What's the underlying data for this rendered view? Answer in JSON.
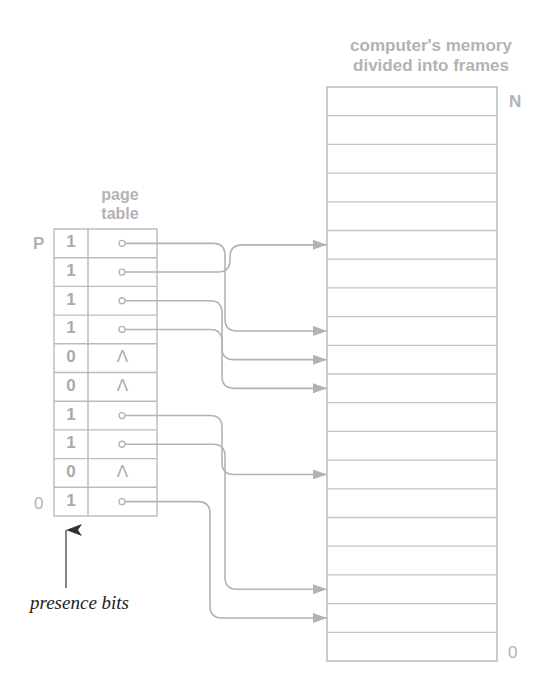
{
  "memory": {
    "title_line1": "computer's memory",
    "title_line2": "divided into frames",
    "top_label": "N",
    "bottom_label": "0",
    "frame_count": 20
  },
  "page_table": {
    "title_line1": "page",
    "title_line2": "table",
    "top_label": "P",
    "bottom_label": "0",
    "rows": [
      {
        "bit": "1",
        "entry": "pointer",
        "target_frame": 12
      },
      {
        "bit": "1",
        "entry": "pointer",
        "target_frame": 15
      },
      {
        "bit": "1",
        "entry": "pointer",
        "target_frame": 11
      },
      {
        "bit": "1",
        "entry": "pointer",
        "target_frame": 10
      },
      {
        "bit": "0",
        "entry": "null",
        "null_symbol": "Λ"
      },
      {
        "bit": "0",
        "entry": "null",
        "null_symbol": "Λ"
      },
      {
        "bit": "1",
        "entry": "pointer",
        "target_frame": 7
      },
      {
        "bit": "1",
        "entry": "pointer",
        "target_frame": 3
      },
      {
        "bit": "0",
        "entry": "null",
        "null_symbol": "Λ"
      },
      {
        "bit": "1",
        "entry": "pointer",
        "target_frame": 2
      }
    ]
  },
  "annotation": {
    "presence_bits": "presence bits"
  },
  "colors": {
    "line": "#b3b3b3",
    "text_gray": "#b3b3b3",
    "text_dark": "#222222"
  }
}
